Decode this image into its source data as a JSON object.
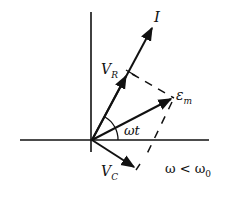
{
  "diagram": {
    "title": "",
    "labels": {
      "current": "I",
      "v_r_main": "V",
      "v_r_sub": "R",
      "emf_main": "ε",
      "emf_sub": "m",
      "angle": "ωt",
      "v_c_main": "V",
      "v_c_sub": "C",
      "condition_main": "ω < ω",
      "condition_sub": "0"
    },
    "phasors": [
      {
        "name": "I",
        "from": [
          92,
          140
        ],
        "to": [
          153,
          26
        ]
      },
      {
        "name": "V_R",
        "from": [
          92,
          140
        ],
        "to": [
          128,
          74
        ]
      },
      {
        "name": "εm",
        "from": [
          92,
          140
        ],
        "to": [
          172,
          98
        ]
      },
      {
        "name": "V_C",
        "from": [
          92,
          140
        ],
        "to": [
          136,
          168
        ]
      }
    ],
    "colors": {
      "ink": "#111111",
      "background": "#ffffff"
    }
  }
}
